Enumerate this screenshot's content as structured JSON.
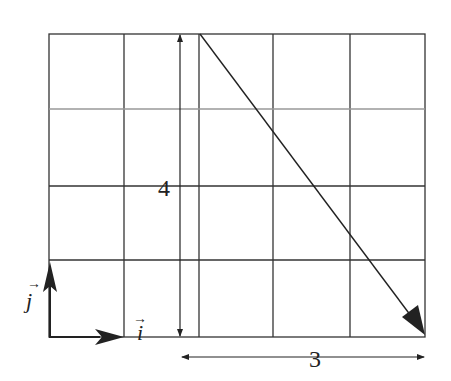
{
  "diagram": {
    "grid": {
      "columns": 5,
      "rows": 4,
      "line_color": "#333333"
    },
    "labels": {
      "vertical_dimension": "4",
      "horizontal_dimension": "3",
      "unit_i": "i",
      "unit_j": "j",
      "unit_arrow_mark": "→"
    },
    "vectors": [
      {
        "name": "resultant",
        "from": [
          3,
          4
        ],
        "to": [
          0,
          0
        ],
        "description": "diagonal vector from top of grid column 2 to bottom-right corner"
      },
      {
        "name": "unit-i",
        "direction": "x"
      },
      {
        "name": "unit-j",
        "direction": "y"
      }
    ]
  }
}
